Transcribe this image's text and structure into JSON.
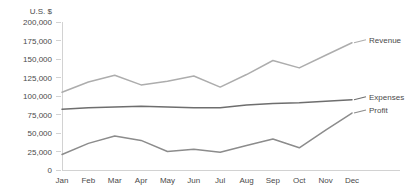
{
  "chart_data": {
    "type": "line",
    "title": "",
    "subtitle": "",
    "xlabel": "",
    "ylabel": "U.S. $",
    "categories": [
      "Jan",
      "Feb",
      "Mar",
      "Apr",
      "May",
      "Jun",
      "Jul",
      "Aug",
      "Sep",
      "Oct",
      "Nov",
      "Dec"
    ],
    "ylim": [
      0,
      200000
    ],
    "ytick_labels": [
      "200,000",
      "175,000",
      "150,000",
      "125,000",
      "100,000",
      "75,000",
      "50,000",
      "25,000",
      "0"
    ],
    "ytick_values": [
      200000,
      175000,
      150000,
      125000,
      100000,
      75000,
      50000,
      25000,
      0
    ],
    "grid": false,
    "legend_position": "right-inline-labels",
    "series": [
      {
        "name": "Revenue",
        "color": "#adadad",
        "values": [
          105000,
          119000,
          128000,
          115000,
          120000,
          127000,
          112000,
          129000,
          148000,
          138000,
          155000,
          172000
        ]
      },
      {
        "name": "Expenses",
        "color": "#6e6e6e",
        "values": [
          82000,
          84000,
          85000,
          86000,
          85000,
          84000,
          84000,
          88000,
          90000,
          91000,
          93000,
          95000
        ]
      },
      {
        "name": "Profit",
        "color": "#8c8c8c",
        "values": [
          21000,
          36000,
          46000,
          40000,
          25000,
          28000,
          24000,
          33000,
          42000,
          30000,
          54000,
          77000
        ]
      }
    ]
  }
}
